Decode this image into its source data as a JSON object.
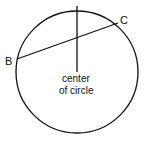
{
  "diagram": {
    "points": {
      "B": "B",
      "C": "C"
    },
    "center_label_line1": "center",
    "center_label_line2": "of circle",
    "colors": {
      "stroke": "#111111",
      "background": "#ffffff"
    }
  }
}
